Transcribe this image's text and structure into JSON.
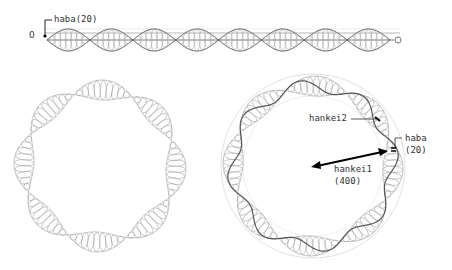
{
  "strip": {
    "zero_label": "0",
    "haba_label": "haba(20)",
    "lobes": 8
  },
  "left_ring": {
    "lobes": 8
  },
  "right_ring": {
    "lobes": 8,
    "hankei2_label": "hankei2",
    "haba_label": "haba",
    "haba_value": "(20)",
    "hankei1_label": "hankei1",
    "hankei1_value": "(400)"
  },
  "colors": {
    "stroke": "#555555",
    "light": "#aaaaaa",
    "arrow": "#000000"
  }
}
